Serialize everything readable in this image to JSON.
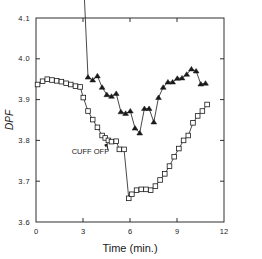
{
  "figure": {
    "background": "#ffffff",
    "foreground": "#1a1a1a"
  },
  "axis": {
    "x_title": "Time (min.)",
    "y_title": "DPF",
    "x_ticks": [
      "0",
      "3",
      "6",
      "9",
      "12"
    ],
    "y_ticks": [
      "4.1",
      "4.0",
      "3.9",
      "3.8",
      "3.7",
      "3.6"
    ]
  },
  "annotations": {
    "cuff_on": "CUFF ON",
    "cuff_off": "CUFF OFF"
  },
  "chart_data": {
    "type": "line",
    "title": "",
    "xlabel": "Time (min.)",
    "ylabel": "DPF",
    "xlim": [
      0,
      12
    ],
    "ylim": [
      3.6,
      4.1
    ],
    "xticks": [
      0,
      3,
      6,
      9,
      12
    ],
    "yticks": [
      3.6,
      3.7,
      3.8,
      3.9,
      4.0,
      4.1
    ],
    "grid": false,
    "legend": "none",
    "annotations": [
      {
        "text": "CUFF ON",
        "x": 3.0,
        "y": 4.27,
        "arrow_to_x": 3.0,
        "arrow_to_y": 4.21,
        "marker": "arrow-down"
      },
      {
        "text": "CUFF OFF",
        "x": 4.1,
        "y": 3.772,
        "arrow_to_x": 4.62,
        "arrow_to_y": 3.797,
        "marker": "arrow-up-right"
      }
    ],
    "series": [
      {
        "name": "upper",
        "marker": "filled-triangle",
        "color": "#1a1a1a",
        "x": [
          0.1,
          0.42,
          0.72,
          1.02,
          1.32,
          1.62,
          1.92,
          2.22,
          2.52,
          2.82,
          3.02,
          3.32,
          3.62,
          3.92,
          4.22,
          4.52,
          4.82,
          5.12,
          5.42,
          5.72,
          6.02,
          6.32,
          6.62,
          6.92,
          7.22,
          7.52,
          7.82,
          8.12,
          8.42,
          8.72,
          9.02,
          9.32,
          9.62,
          9.92,
          10.22,
          10.52,
          10.82
        ],
        "y": [
          4.246,
          4.247,
          4.245,
          4.238,
          4.231,
          4.224,
          4.215,
          4.212,
          4.21,
          4.212,
          4.208,
          3.955,
          3.948,
          3.958,
          3.93,
          3.912,
          3.908,
          3.915,
          3.87,
          3.866,
          3.872,
          3.83,
          3.818,
          3.878,
          3.878,
          3.845,
          3.905,
          3.93,
          3.943,
          3.943,
          3.952,
          3.953,
          3.962,
          3.975,
          3.97,
          3.938,
          3.94
        ]
      },
      {
        "name": "lower",
        "marker": "open-square",
        "color": "#1a1a1a",
        "x": [
          0.1,
          0.42,
          0.72,
          1.02,
          1.32,
          1.62,
          1.92,
          2.22,
          2.52,
          2.82,
          3.02,
          3.32,
          3.62,
          3.92,
          4.22,
          4.42,
          4.62,
          4.82,
          5.12,
          5.32,
          5.62,
          5.92,
          6.12,
          6.42,
          6.72,
          7.02,
          7.32,
          7.62,
          7.92,
          8.22,
          8.52,
          8.82,
          9.12,
          9.42,
          9.72,
          10.02,
          10.32,
          10.62,
          10.92
        ],
        "y": [
          3.937,
          3.945,
          3.95,
          3.948,
          3.946,
          3.944,
          3.94,
          3.937,
          3.933,
          3.931,
          3.905,
          3.872,
          3.851,
          3.832,
          3.812,
          3.806,
          3.8,
          3.797,
          3.798,
          3.778,
          3.778,
          3.658,
          3.668,
          3.678,
          3.68,
          3.68,
          3.678,
          3.688,
          3.703,
          3.718,
          3.737,
          3.76,
          3.78,
          3.8,
          3.812,
          3.843,
          3.86,
          3.872,
          3.888
        ]
      }
    ]
  }
}
